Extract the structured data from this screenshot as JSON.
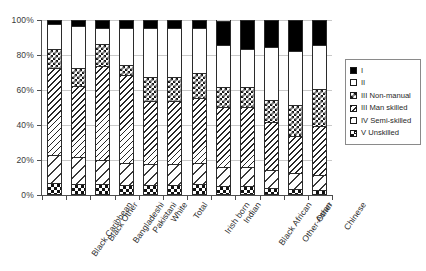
{
  "chart_data": {
    "type": "bar",
    "variant": "stacked-100",
    "title": "",
    "subtitle": "",
    "xlabel": "",
    "ylabel": "",
    "ylim": [
      0,
      100
    ],
    "ytick_labels": [
      "0%",
      "20%",
      "40%",
      "60%",
      "80%",
      "100%"
    ],
    "ytick_values": [
      0,
      20,
      40,
      60,
      80,
      100
    ],
    "grid": true,
    "legend_position": "right",
    "categories": [
      "Black Caribbean",
      "Black Other",
      "Bangladeshi",
      "Pakistani",
      "White",
      "Total",
      "Irish born",
      "Indian",
      "Black African",
      "Other-Other",
      "Asian",
      "Chinese"
    ],
    "series": [
      {
        "name": "V Unskilled",
        "pattern": "coarse-checkerboard",
        "values": [
          6.5,
          6.0,
          5.5,
          5.0,
          5.0,
          5.0,
          5.5,
          4.5,
          4.5,
          3.5,
          3.0,
          2.5
        ]
      },
      {
        "name": "IV Semi-skilled",
        "pattern": "wide-diagonal-hatch",
        "values": [
          16.0,
          15.0,
          14.0,
          13.0,
          12.0,
          12.0,
          12.5,
          11.0,
          11.0,
          10.0,
          9.0,
          8.5
        ]
      },
      {
        "name": "III Man skilled",
        "pattern": "dense-diagonal-hatch",
        "values": [
          49.5,
          41.0,
          53.5,
          50.0,
          36.0,
          36.0,
          37.0,
          34.5,
          34.5,
          27.5,
          21.0,
          28.0
        ]
      },
      {
        "name": "III Non-manual",
        "pattern": "fine-checkerboard",
        "values": [
          11.0,
          10.0,
          13.0,
          6.0,
          14.0,
          14.0,
          14.0,
          11.0,
          11.0,
          13.0,
          18.0,
          21.0
        ]
      },
      {
        "name": "II",
        "pattern": "white",
        "values": [
          14.0,
          24.0,
          9.0,
          21.0,
          28.0,
          28.0,
          26.0,
          24.0,
          22.0,
          30.0,
          31.0,
          25.0
        ]
      },
      {
        "name": "I",
        "pattern": "solid-black",
        "values": [
          3.0,
          4.0,
          5.0,
          5.0,
          5.0,
          5.0,
          5.0,
          14.5,
          17.0,
          16.0,
          18.0,
          15.0
        ]
      }
    ]
  },
  "legend": {
    "items": [
      {
        "label": "I",
        "pattern": "solid-black"
      },
      {
        "label": "II",
        "pattern": "white"
      },
      {
        "label": "III Non-manual",
        "pattern": "fine-checkerboard"
      },
      {
        "label": "III Man skilled",
        "pattern": "dense-diagonal-hatch"
      },
      {
        "label": "IV Semi-skilled",
        "pattern": "wide-diagonal-hatch"
      },
      {
        "label": "V Unskilled",
        "pattern": "coarse-checkerboard"
      }
    ]
  }
}
